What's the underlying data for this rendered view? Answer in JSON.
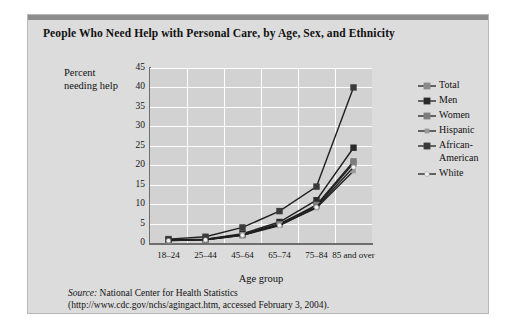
{
  "chart_data": {
    "type": "line",
    "title": "People Who Need Help with Personal Care, by Age, Sex, and Ethnicity",
    "xlabel": "Age group",
    "ylabel": "Percent needing help",
    "categories": [
      "18–24",
      "25–44",
      "45–64",
      "65–74",
      "75–84",
      "85 and\nover"
    ],
    "ylim": [
      0,
      45
    ],
    "yticks": [
      0,
      5,
      10,
      15,
      20,
      25,
      30,
      35,
      40,
      45
    ],
    "grid": true,
    "legend_position": "right",
    "series": [
      {
        "name": "Total",
        "values": [
          0.7,
          0.9,
          2.2,
          5.0,
          9.5,
          20.5
        ],
        "color": "#8a8a8a",
        "marker": "diamond"
      },
      {
        "name": "Men",
        "values": [
          0.8,
          1.0,
          2.4,
          5.4,
          11.0,
          24.5
        ],
        "color": "#2b2b2b",
        "marker": "diamond"
      },
      {
        "name": "Women",
        "values": [
          0.6,
          0.8,
          2.0,
          4.8,
          9.8,
          21.0
        ],
        "color": "#7d7d7d",
        "marker": "diamond"
      },
      {
        "name": "Hispanic",
        "values": [
          0.7,
          0.9,
          2.1,
          4.6,
          9.0,
          18.5
        ],
        "color": "#9a9a9a",
        "marker": "small-diamond"
      },
      {
        "name": "African-\nAmerican",
        "values": [
          1.0,
          1.6,
          4.0,
          8.2,
          14.5,
          40.0
        ],
        "color": "#3a3a3a",
        "marker": "diamond"
      },
      {
        "name": "White",
        "values": [
          0.6,
          0.8,
          2.0,
          4.5,
          9.2,
          19.5
        ],
        "color": "#f2f2f2",
        "marker": "dot"
      }
    ]
  },
  "source": {
    "label": "Source:",
    "line1_rest": " National Center for Health Statistics",
    "line2": "(http://www.cdc.gov/nchs/agingact.htm, accessed February 3, 2004)."
  },
  "colors": {
    "card_background": "#dcdcdc",
    "plot_background": "#d2d2d2",
    "grid": "#ffffff",
    "axis": "#6e6e6e",
    "topbar": "#8d8d8d",
    "page": "#ffffff"
  }
}
